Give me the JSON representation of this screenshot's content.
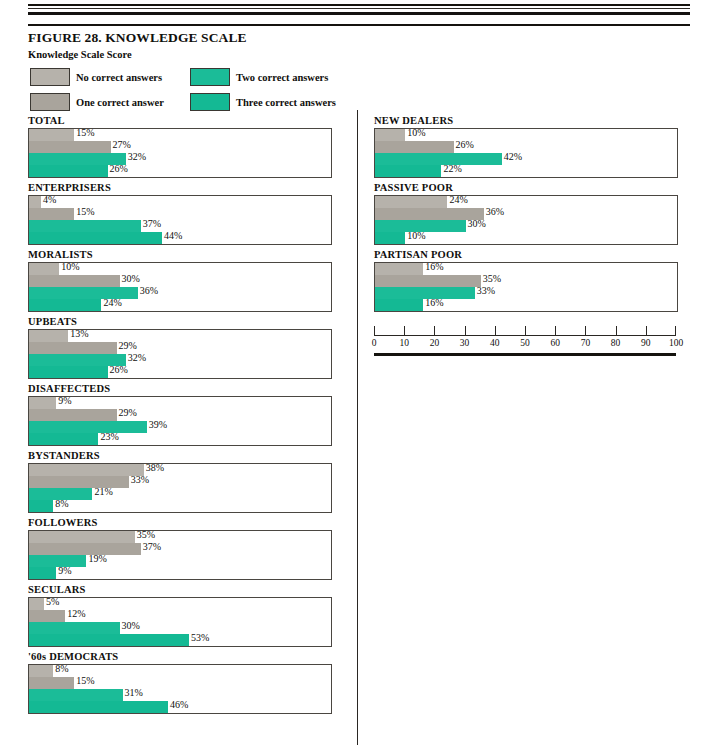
{
  "figure": {
    "title": "FIGURE 28. KNOWLEDGE SCALE",
    "subtitle": "Knowledge Scale Score"
  },
  "legend": [
    {
      "label": "No correct answers",
      "color": "#b6b2ab"
    },
    {
      "label": "Two correct answers",
      "color": "#1bbc98"
    },
    {
      "label": "One correct answer",
      "color": "#a9a49c"
    },
    {
      "label": "Three correct answers",
      "color": "#14b994"
    }
  ],
  "colors": {
    "no_correct": "#b6b2ab",
    "one_correct": "#a9a49c",
    "two_correct": "#1bbc98",
    "three_correct": "#14b994",
    "frame": "#4a4641",
    "ink": "#100f0d"
  },
  "axis": {
    "min": 0,
    "max": 100,
    "step": 10,
    "ticks": [
      "0",
      "10",
      "20",
      "30",
      "40",
      "50",
      "60",
      "70",
      "80",
      "90",
      "100"
    ]
  },
  "chart_data": {
    "type": "bar",
    "title": "FIGURE 28. KNOWLEDGE SCALE",
    "subtitle": "Knowledge Scale Score",
    "orientation": "horizontal",
    "xlabel": "",
    "ylabel": "",
    "xlim": [
      0,
      100
    ],
    "grid": false,
    "legend_position": "top-left",
    "series": [
      {
        "name": "No correct answers",
        "color": "#b6b2ab"
      },
      {
        "name": "One correct answer",
        "color": "#a9a49c"
      },
      {
        "name": "Two correct answers",
        "color": "#1bbc98"
      },
      {
        "name": "Three correct answers",
        "color": "#14b994"
      }
    ],
    "panels": [
      {
        "column": "left",
        "category": "TOTAL",
        "values": [
          15,
          27,
          32,
          26
        ],
        "labels": [
          "15%",
          "27%",
          "32%",
          "26%"
        ]
      },
      {
        "column": "left",
        "category": "ENTERPRISERS",
        "values": [
          4,
          15,
          37,
          44
        ],
        "labels": [
          "4%",
          "15%",
          "37%",
          "44%"
        ]
      },
      {
        "column": "left",
        "category": "MORALISTS",
        "values": [
          10,
          30,
          36,
          24
        ],
        "labels": [
          "10%",
          "30%",
          "36%",
          "24%"
        ]
      },
      {
        "column": "left",
        "category": "UPBEATS",
        "values": [
          13,
          29,
          32,
          26
        ],
        "labels": [
          "13%",
          "29%",
          "32%",
          "26%"
        ]
      },
      {
        "column": "left",
        "category": "DISAFFECTEDS",
        "values": [
          9,
          29,
          39,
          23
        ],
        "labels": [
          "9%",
          "29%",
          "39%",
          "23%"
        ]
      },
      {
        "column": "left",
        "category": "BYSTANDERS",
        "values": [
          38,
          33,
          21,
          8
        ],
        "labels": [
          "38%",
          "33%",
          "21%",
          "8%"
        ]
      },
      {
        "column": "left",
        "category": "FOLLOWERS",
        "values": [
          35,
          37,
          19,
          9
        ],
        "labels": [
          "35%",
          "37%",
          "19%",
          "9%"
        ]
      },
      {
        "column": "left",
        "category": "SECULARS",
        "values": [
          5,
          12,
          30,
          53
        ],
        "labels": [
          "5%",
          "12%",
          "30%",
          "53%"
        ]
      },
      {
        "column": "left",
        "category": "'60s DEMOCRATS",
        "values": [
          8,
          15,
          31,
          46
        ],
        "labels": [
          "8%",
          "15%",
          "31%",
          "46%"
        ]
      },
      {
        "column": "right",
        "category": "NEW DEALERS",
        "values": [
          10,
          26,
          42,
          22
        ],
        "labels": [
          "10%",
          "26%",
          "42%",
          "22%"
        ]
      },
      {
        "column": "right",
        "category": "PASSIVE POOR",
        "values": [
          24,
          36,
          30,
          10
        ],
        "labels": [
          "24%",
          "36%",
          "30%",
          "10%"
        ]
      },
      {
        "column": "right",
        "category": "PARTISAN POOR",
        "values": [
          16,
          35,
          33,
          16
        ],
        "labels": [
          "16%",
          "35%",
          "33%",
          "16%"
        ]
      }
    ]
  }
}
